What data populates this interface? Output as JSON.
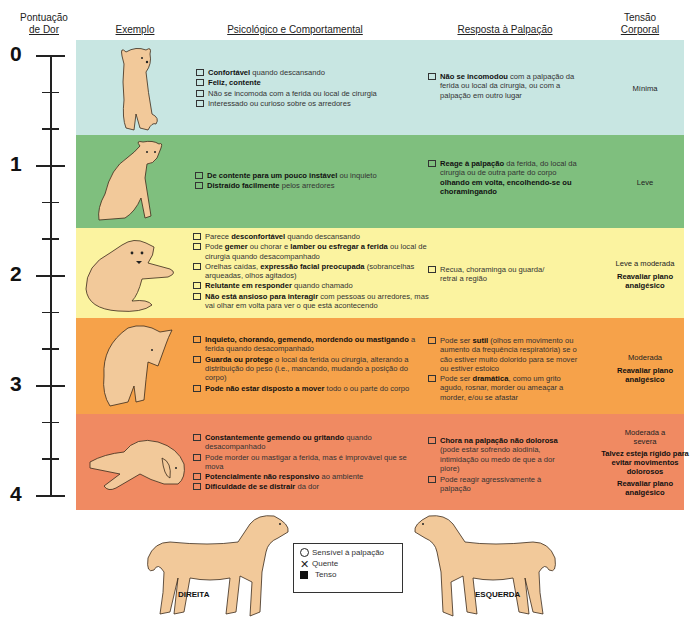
{
  "headers": {
    "pain_score": [
      "Pontuação",
      "de Dor"
    ],
    "example": "Exemplo",
    "psych": "Psicológico e Comportamental",
    "palpation": "Resposta à Palpação",
    "tension": [
      "Tensão",
      "Corporal"
    ]
  },
  "scale": [
    "0",
    "1",
    "2",
    "3",
    "4"
  ],
  "colors": {
    "band0": "#c8e6e2",
    "band1": "#7fbf7e",
    "band2": "#fbf3a0",
    "band3": "#f6a24a",
    "band4": "#f08a62",
    "dog": "#f2c99a"
  },
  "levels": [
    {
      "psych": [
        {
          "bold": "Confortável",
          "rest": " quando descansando"
        },
        {
          "bold": "Feliz, contente",
          "rest": ""
        },
        {
          "bold": "",
          "rest": "Não se incomoda com a ferida ou local de cirurgia"
        },
        {
          "bold": "",
          "rest": "Interessado ou curioso sobre os arredores"
        }
      ],
      "palpation": [
        {
          "bold": "Não se incomodou",
          "rest": " com a palpação da ferida ou local da cirurgia, ou com a palpação em outro lugar"
        }
      ],
      "tension": [
        {
          "text": "Mínima",
          "bold": false
        }
      ]
    },
    {
      "psych": [
        {
          "bold": "De contente para um pouco instável",
          "rest": " ou inquieto"
        },
        {
          "bold": "Distraído facilmente",
          "rest": " pelos arredores"
        }
      ],
      "palpation": [
        {
          "bold": "Reage à palpação",
          "rest": " da ferida, do local da cirurgia ou de outra parte do corpo ",
          "bold2": "olhando em volta, encolhendo-se ou choramingando"
        }
      ],
      "tension": [
        {
          "text": "Leve",
          "bold": false
        }
      ]
    },
    {
      "psych": [
        {
          "pre": "Parece ",
          "bold": "desconfortável",
          "rest": " quando descansando"
        },
        {
          "pre": "Pode ",
          "bold": "gemer",
          "rest": " ou chorar e ",
          "bold2": "lamber ou esfregar a ferida",
          "rest2": " ou local de cirurgia quando desacompanhado"
        },
        {
          "pre": "Orelhas caídas, ",
          "bold": "expressão facial preocupada",
          "rest": " (sobrancelhas arqueadas, olhos agitados)"
        },
        {
          "bold": "Relutante em responder",
          "rest": " quando chamado"
        },
        {
          "bold": "Não está ansioso para interagir",
          "rest": " com pessoas ou arredores, mas vai olhar em volta para ver o que está acontecendo"
        }
      ],
      "palpation": [
        {
          "bold": "",
          "rest": "Recua, choraminga ou guarda/ retrai a região"
        }
      ],
      "tension": [
        {
          "text": "Leve a moderada",
          "bold": false
        },
        {
          "text": "Reavaliar plano analgésico",
          "bold": true
        }
      ]
    },
    {
      "psych": [
        {
          "bold": "Inquieto, chorando, gemendo, mordendo ou mastigando",
          "rest": " a ferida quando desacompanhado"
        },
        {
          "bold": "Guarda ou protege",
          "rest": " o local da ferida ou cirurgia, alterando a distribuição do peso (i.e., mancando, mudando a posição do corpo)"
        },
        {
          "bold": "Pode não estar disposto a mover",
          "rest": " todo o ou parte do corpo"
        }
      ],
      "palpation": [
        {
          "pre": "Pode ser ",
          "bold": "sutil",
          "rest": " (olhos em movimento ou aumento da frequência respiratória) se o cão estiver muito dolorido para se mover ou estiver estoico"
        },
        {
          "pre": "Pode ser ",
          "bold": "dramática",
          "rest": ", como um grito agudo, rosnar, morder ou ameaçar a morder, e/ou se afastar"
        }
      ],
      "tension": [
        {
          "text": "Moderada",
          "bold": false
        },
        {
          "text": "Reavaliar plano analgésico",
          "bold": true
        }
      ]
    },
    {
      "psych": [
        {
          "bold": "Constantemente gemendo ou gritando",
          "rest": " quando desacompanhado"
        },
        {
          "bold": "",
          "rest": "Pode morder ou mastigar a ferida, mas é improvável que se mova"
        },
        {
          "bold": "Potencialmente não responsivo",
          "rest": " ao ambiente"
        },
        {
          "bold": "Dificuldade de se distrair",
          "rest": " da dor"
        }
      ],
      "palpation": [
        {
          "bold": "Chora na palpação não dolorosa",
          "rest": " (pode estar sofrendo alodinia, intimidação ou medo de que a dor piore)"
        },
        {
          "bold": "",
          "rest": "Pode reagir agressivamente à palpação"
        }
      ],
      "tension": [
        {
          "text": "Moderada a severa",
          "bold": false
        },
        {
          "text": "Talvez esteja rígido para evitar movimentos dolorosos",
          "bold": true
        },
        {
          "text": "Reavaliar plano analgésico",
          "bold": true
        }
      ]
    }
  ],
  "bottom": {
    "right_label": "DIREITA",
    "left_label": "ESQUERDA",
    "legend": [
      {
        "icon": "circle",
        "label": "Sensível à palpação"
      },
      {
        "icon": "x",
        "label": "Quente"
      },
      {
        "icon": "square",
        "label": "Tenso"
      }
    ]
  }
}
